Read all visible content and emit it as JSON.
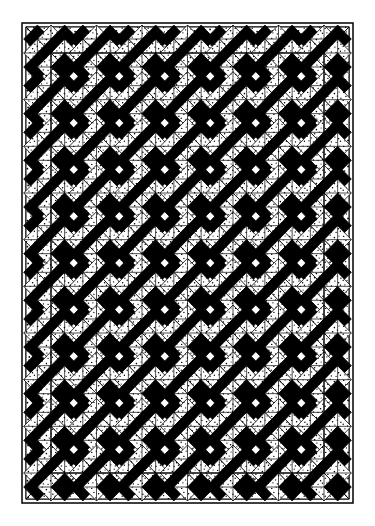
{
  "document": {
    "kind": "quilt-pattern-diagram",
    "title": "Single Irish Chain Quilt Layout Diagram",
    "orientation": "portrait",
    "rendering": "black-and-white line drawing with stippled shading"
  },
  "canvas": {
    "width": 375,
    "height": 526,
    "background_color": "#ffffff"
  },
  "palette": {
    "ink": "#000000",
    "background": "#ffffff",
    "dark_fabric": "#000000",
    "light_fabric": "#ffffff",
    "stipple_fabric": "#ffffff",
    "stipple_dot": "#000000",
    "line_color": "#000000"
  },
  "frame": {
    "outer_edge": {
      "name": "quilt-outer-edge",
      "x": 22,
      "y": 23,
      "width": 331,
      "height": 480,
      "stroke_width": 1.4
    },
    "binding": {
      "name": "binding-strip",
      "label": "narrow white binding",
      "inset": 4,
      "fill": "#ffffff"
    },
    "border": {
      "name": "stippled-border",
      "label": "stippled print border with mitered corners",
      "width": 26,
      "fill": "#ffffff",
      "texture": "stipple",
      "miter": true
    },
    "inner_edge": {
      "name": "quilt-inner-field-edge",
      "x": 51,
      "y": 53,
      "width": 273,
      "height": 420,
      "stroke_width": 1.2
    }
  },
  "field": {
    "name": "quilt-center-field",
    "x": 51,
    "y": 53,
    "width": 273,
    "height": 420,
    "columns": 6,
    "rows": 9,
    "cell_width": 45.5,
    "cell_height": 46.67,
    "layout": "alternating snowball and nine-patch blocks on a straight set",
    "note": "every grid cell carries a snowball block; nine-patch chain units sit at every block intersection"
  },
  "blocks": {
    "snowball": {
      "name": "snowball-block",
      "label": "Snowball block",
      "count": 54,
      "fill": "#ffffff",
      "corner_fraction": 0.3,
      "description": "plain white square with corners trimmed to form an octagon"
    },
    "nine_patch": {
      "name": "nine-patch-block",
      "label": "Nine-patch chain block",
      "fill_dark": "#000000",
      "fill_stipple": "#ffffff",
      "description": "three by three unit with dark corners and center, stippled on-point squares between them"
    },
    "chain_square": {
      "name": "chain-square",
      "label": "stippled on-point chain square",
      "texture": "stipple"
    },
    "dark_square": {
      "name": "dark-square",
      "label": "solid dark chain square",
      "fill": "#000000"
    }
  },
  "legend": {
    "fabrics": [
      {
        "name": "fabric-dark",
        "label": "Dark solid",
        "swatch": "#000000"
      },
      {
        "name": "fabric-light",
        "label": "Light background",
        "swatch": "#ffffff"
      },
      {
        "name": "fabric-stipple",
        "label": "Stipple print",
        "swatch": "#ffffff"
      }
    ]
  },
  "measurements": {
    "grid_columns": 6,
    "grid_rows": 9,
    "border_width_px": 26,
    "field_width_px": 273,
    "field_height_px": 420
  }
}
